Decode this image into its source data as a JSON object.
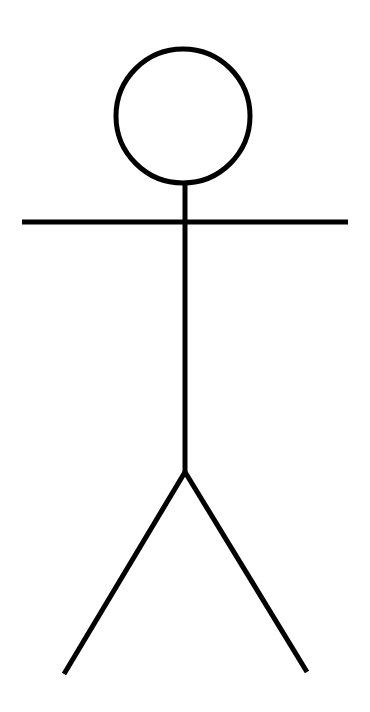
{
  "figure": {
    "type": "stick-figure",
    "background": "#ffffff",
    "stroke_color": "#000000",
    "stroke_width": 5,
    "head": {
      "cx": 183,
      "cy": 116,
      "r": 67
    },
    "neck_spine": {
      "x1": 185,
      "y1": 184,
      "x2": 185,
      "y2": 472
    },
    "arms": {
      "x1": 22,
      "y1": 222,
      "x2": 348,
      "y2": 222
    },
    "left_leg": {
      "x1": 185,
      "y1": 472,
      "x2": 64,
      "y2": 674
    },
    "right_leg": {
      "x1": 185,
      "y1": 472,
      "x2": 307,
      "y2": 672
    }
  }
}
